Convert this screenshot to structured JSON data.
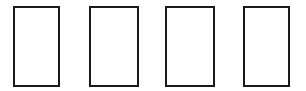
{
  "diagram": {
    "type": "row-of-empty-rectangles",
    "stroke_color": "#1a1a1a",
    "fill_color": "#ffffff",
    "rectangles": [
      {
        "x": 13,
        "y": 6,
        "w": 47,
        "h": 81
      },
      {
        "x": 89,
        "y": 6,
        "w": 50,
        "h": 81
      },
      {
        "x": 165,
        "y": 6,
        "w": 50,
        "h": 81
      },
      {
        "x": 243,
        "y": 6,
        "w": 47,
        "h": 81
      }
    ]
  }
}
